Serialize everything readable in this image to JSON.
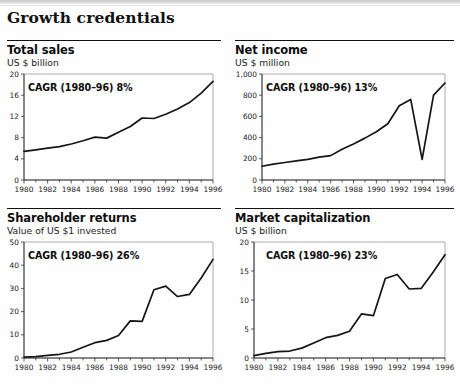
{
  "header": {
    "title": "Growth credentials"
  },
  "panels": [
    {
      "key": "total_sales",
      "title": "Total sales",
      "subtitle": "US $ billion",
      "annotation": "CAGR (1980–96) 8%"
    },
    {
      "key": "net_income",
      "title": "Net income",
      "subtitle": "US $ million",
      "annotation": "CAGR (1980–96) 13%"
    },
    {
      "key": "shareholder_returns",
      "title": "Shareholder returns",
      "subtitle": "Value of US $1 invested",
      "annotation": "CAGR (1980–96) 26%"
    },
    {
      "key": "market_capitalization",
      "title": "Market capitalization",
      "subtitle": "US $ billion",
      "annotation": "CAGR (1980–96) 23%"
    }
  ],
  "chart_data": [
    {
      "type": "line",
      "title": "Total sales",
      "subtitle": "US $ billion",
      "annotation": "CAGR (1980–96) 8%",
      "xlabel": "",
      "ylabel": "US $ billion",
      "xlim": [
        1980,
        1996
      ],
      "ylim": [
        0,
        20
      ],
      "yticks": [
        0,
        4,
        8,
        12,
        16,
        20
      ],
      "ytick_labels": [
        "0",
        "4",
        "8",
        "12",
        "16",
        "20"
      ],
      "xticks": [
        1980,
        1982,
        1984,
        1986,
        1988,
        1990,
        1992,
        1994,
        1996
      ],
      "xtick_labels": [
        "1980",
        "1982",
        "1984",
        "1986",
        "1988",
        "1990",
        "1992",
        "1994",
        "1996"
      ],
      "x": [
        1980,
        1981,
        1982,
        1983,
        1984,
        1985,
        1986,
        1987,
        1988,
        1989,
        1990,
        1991,
        1992,
        1993,
        1994,
        1995,
        1996
      ],
      "values": [
        5.4,
        5.7,
        6.0,
        6.3,
        6.8,
        7.4,
        8.1,
        7.9,
        9.0,
        10.1,
        11.7,
        11.6,
        12.4,
        13.4,
        14.6,
        16.4,
        18.6
      ],
      "grid": false,
      "legend": "none"
    },
    {
      "type": "line",
      "title": "Net income",
      "subtitle": "US $ million",
      "annotation": "CAGR (1980–96) 13%",
      "xlabel": "",
      "ylabel": "US $ million",
      "xlim": [
        1980,
        1996
      ],
      "ylim": [
        0,
        1000
      ],
      "yticks": [
        0,
        200,
        400,
        600,
        800,
        1000
      ],
      "ytick_labels": [
        "0",
        "200",
        "400",
        "600",
        "800",
        "1,000"
      ],
      "xticks": [
        1980,
        1982,
        1984,
        1986,
        1988,
        1990,
        1992,
        1994,
        1996
      ],
      "xtick_labels": [
        "1980",
        "1982",
        "1984",
        "1986",
        "1988",
        "1990",
        "1992",
        "1994",
        "1996"
      ],
      "x": [
        1980,
        1981,
        1982,
        1983,
        1984,
        1985,
        1986,
        1987,
        1988,
        1989,
        1990,
        1991,
        1992,
        1993,
        1994,
        1995,
        1996
      ],
      "values": [
        130,
        150,
        165,
        180,
        195,
        215,
        230,
        290,
        340,
        395,
        455,
        530,
        700,
        760,
        195,
        800,
        915
      ],
      "grid": false,
      "legend": "none"
    },
    {
      "type": "line",
      "title": "Shareholder returns",
      "subtitle": "Value of US $1 invested",
      "annotation": "CAGR (1980–96) 26%",
      "xlabel": "",
      "ylabel": "Value of US $1 invested",
      "xlim": [
        1980,
        1996
      ],
      "ylim": [
        0,
        50
      ],
      "yticks": [
        0,
        10,
        20,
        30,
        40,
        50
      ],
      "ytick_labels": [
        "0",
        "10",
        "20",
        "30",
        "40",
        "50"
      ],
      "xticks": [
        1980,
        1982,
        1984,
        1986,
        1988,
        1990,
        1992,
        1994,
        1996
      ],
      "xtick_labels": [
        "1980",
        "1982",
        "1984",
        "1986",
        "1988",
        "1990",
        "1992",
        "1994",
        "1996"
      ],
      "x": [
        1980,
        1981,
        1982,
        1983,
        1984,
        1985,
        1986,
        1987,
        1988,
        1989,
        1990,
        1991,
        1992,
        1993,
        1994,
        1995,
        1996
      ],
      "values": [
        0.4,
        0.6,
        1.1,
        1.6,
        2.6,
        4.6,
        6.6,
        7.6,
        9.7,
        16.0,
        15.8,
        29.4,
        31.0,
        26.5,
        27.4,
        34.5,
        42.5
      ],
      "grid": false,
      "legend": "none"
    },
    {
      "type": "line",
      "title": "Market capitalization",
      "subtitle": "US $ billion",
      "annotation": "CAGR (1980–96) 23%",
      "xlabel": "",
      "ylabel": "US $ billion",
      "xlim": [
        1980,
        1996
      ],
      "ylim": [
        0,
        20
      ],
      "yticks": [
        0,
        5,
        10,
        15,
        20
      ],
      "ytick_labels": [
        "0",
        "5",
        "10",
        "15",
        "20"
      ],
      "xticks": [
        1980,
        1982,
        1984,
        1986,
        1988,
        1990,
        1992,
        1994,
        1996
      ],
      "xtick_labels": [
        "1980",
        "1982",
        "1984",
        "1986",
        "1988",
        "1990",
        "1992",
        "1994",
        "1996"
      ],
      "x": [
        1980,
        1981,
        1982,
        1983,
        1984,
        1985,
        1986,
        1987,
        1988,
        1989,
        1990,
        1991,
        1992,
        1993,
        1994,
        1995,
        1996
      ],
      "values": [
        0.4,
        0.8,
        1.1,
        1.2,
        1.7,
        2.6,
        3.5,
        3.9,
        4.6,
        7.6,
        7.3,
        13.7,
        14.4,
        11.9,
        12.0,
        14.8,
        17.8
      ],
      "grid": false,
      "legend": "none"
    }
  ],
  "colors": {
    "line": "#151515",
    "axis": "#111111",
    "frame": "#9a9a9a",
    "text": "#1a1a1a",
    "background": "#fefefe",
    "topbar": "#c9c9c9"
  }
}
